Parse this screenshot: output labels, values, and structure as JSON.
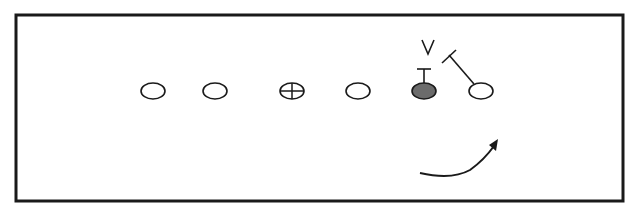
{
  "diagram": {
    "type": "football-play",
    "border_color": "#1a1a1a",
    "ink_color": "#1a1a1a",
    "shaded_fill": "#6b6b6b",
    "players": [
      {
        "id": "p1",
        "shape": "open-oval",
        "cx": 153,
        "cy": 91
      },
      {
        "id": "p2",
        "shape": "open-oval",
        "cx": 215,
        "cy": 91
      },
      {
        "id": "center",
        "shape": "crossed-oval",
        "cx": 292,
        "cy": 91
      },
      {
        "id": "p4",
        "shape": "open-oval",
        "cx": 358,
        "cy": 91
      },
      {
        "id": "shaded",
        "shape": "shaded-oval",
        "cx": 424,
        "cy": 91
      },
      {
        "id": "end",
        "shape": "open-oval",
        "cx": 481,
        "cy": 91
      }
    ],
    "defender_label": "V",
    "annotations": {
      "block_marker_shaded": "T-block",
      "block_marker_end": "angled-block",
      "motion_arrow": "curved-arrow"
    }
  }
}
